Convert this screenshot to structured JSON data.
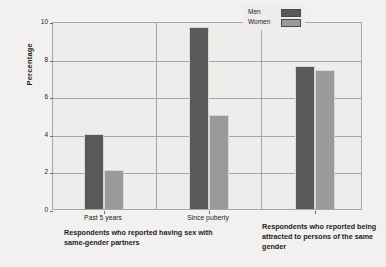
{
  "chart_data": {
    "type": "bar",
    "title": "",
    "subtitle": "",
    "xlabel": "",
    "ylabel": "Percentage",
    "ylim": [
      0,
      10
    ],
    "yticks": [
      0,
      2,
      4,
      6,
      8,
      10
    ],
    "ytick_labels": [
      "0",
      "2",
      "4",
      "6",
      "8",
      "10"
    ],
    "grid": true,
    "legend_position": "top-right-inside",
    "categories": [
      "Past 5 years",
      "Since puberty",
      "Same-gender attraction"
    ],
    "category_tick_labels": [
      "Past 5 years",
      "Since puberty",
      ""
    ],
    "series": [
      {
        "name": "Men",
        "color": "#595959",
        "values": [
          4.0,
          9.7,
          7.6
        ]
      },
      {
        "name": "Women",
        "color": "#9a9a9a",
        "values": [
          2.1,
          5.0,
          7.4
        ]
      }
    ],
    "panel_captions": [
      "Respondents who reported having sex with same-gender partners",
      "Respondents who reported being attracted to persons of the same gender"
    ]
  },
  "axis": {
    "y_title": "Percentage",
    "ticks": [
      {
        "label": "10",
        "value": 10
      },
      {
        "label": "8",
        "value": 8
      },
      {
        "label": "6",
        "value": 6
      },
      {
        "label": "4",
        "value": 4
      },
      {
        "label": "2",
        "value": 2
      },
      {
        "label": "0",
        "value": 0
      }
    ]
  },
  "legend": {
    "items": [
      {
        "label": "Men",
        "color": "#595959"
      },
      {
        "label": "Women",
        "color": "#9a9a9a"
      }
    ]
  },
  "groups": [
    {
      "tick_label": "Past 5 years",
      "men": 4.0,
      "women": 2.1
    },
    {
      "tick_label": "Since puberty",
      "men": 9.7,
      "women": 5.0
    },
    {
      "tick_label": "",
      "men": 7.6,
      "women": 7.4
    }
  ],
  "captions": {
    "left": "Respondents who reported having sex with same-gender partners",
    "right": "Respondents who reported being attracted to persons of the same gender"
  }
}
